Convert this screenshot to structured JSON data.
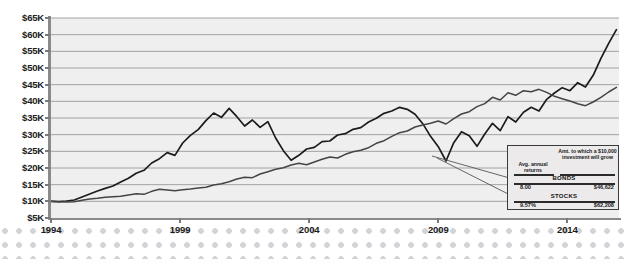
{
  "chart_data": {
    "type": "line",
    "title": "",
    "xlabel": "",
    "ylabel": "",
    "xlim": [
      1994,
      2016
    ],
    "ylim": [
      5000,
      65000
    ],
    "grid": true,
    "legend_position": "inside-bottom-right",
    "y_ticks": [
      "$5K",
      "$10K",
      "$15K",
      "$20K",
      "$25K",
      "$30K",
      "$35K",
      "$40K",
      "$45K",
      "$50K",
      "$55K",
      "$60K",
      "$65K"
    ],
    "y_tick_values": [
      5000,
      10000,
      15000,
      20000,
      25000,
      30000,
      35000,
      40000,
      45000,
      50000,
      55000,
      60000,
      65000
    ],
    "x_ticks": [
      "1994",
      "1999",
      "2004",
      "2009",
      "2014"
    ],
    "x_tick_values": [
      1994,
      1999,
      2004,
      2009,
      2014
    ],
    "series": [
      {
        "name": "STOCKS",
        "color": "#1c1c1c",
        "x": [
          1994.0,
          1994.3,
          1994.6,
          1994.9,
          1995.2,
          1995.5,
          1995.8,
          1996.1,
          1996.4,
          1996.7,
          1997.0,
          1997.3,
          1997.6,
          1997.9,
          1998.2,
          1998.5,
          1998.8,
          1999.1,
          1999.4,
          1999.7,
          2000.0,
          2000.3,
          2000.6,
          2000.9,
          2001.2,
          2001.5,
          2001.8,
          2002.1,
          2002.4,
          2002.7,
          2003.0,
          2003.3,
          2003.6,
          2003.9,
          2004.2,
          2004.5,
          2004.8,
          2005.1,
          2005.4,
          2005.7,
          2006.0,
          2006.3,
          2006.6,
          2006.9,
          2007.2,
          2007.5,
          2007.8,
          2008.1,
          2008.4,
          2008.7,
          2009.0,
          2009.3,
          2009.6,
          2009.9,
          2010.2,
          2010.5,
          2010.8,
          2011.1,
          2011.4,
          2011.7,
          2012.0,
          2012.3,
          2012.6,
          2012.9,
          2013.2,
          2013.5,
          2013.8,
          2014.1,
          2014.4,
          2014.7,
          2015.0,
          2015.3,
          2015.6,
          2015.9
        ],
        "values": [
          10000,
          9900,
          10100,
          10400,
          11300,
          12200,
          13100,
          13900,
          14600,
          15800,
          16900,
          18400,
          19300,
          21500,
          22800,
          24600,
          23800,
          27500,
          29800,
          31500,
          34200,
          36500,
          35200,
          37900,
          35400,
          32600,
          34400,
          32200,
          33900,
          29000,
          25200,
          22300,
          23800,
          25700,
          26200,
          27900,
          28100,
          29900,
          30300,
          31600,
          32100,
          33800,
          34900,
          36400,
          37100,
          38200,
          37600,
          36100,
          33300,
          29500,
          26400,
          22100,
          27600,
          30900,
          29700,
          26500,
          30200,
          33400,
          31200,
          35400,
          33800,
          36700,
          38200,
          37100,
          40600,
          42500,
          44100,
          43200,
          45600,
          44300,
          47800,
          52900,
          57400,
          61500
        ]
      },
      {
        "name": "BONDS",
        "color": "#444444",
        "x": [
          1994.0,
          1994.3,
          1994.6,
          1994.9,
          1995.2,
          1995.5,
          1995.8,
          1996.1,
          1996.4,
          1996.7,
          1997.0,
          1997.3,
          1997.6,
          1997.9,
          1998.2,
          1998.5,
          1998.8,
          1999.1,
          1999.4,
          1999.7,
          2000.0,
          2000.3,
          2000.6,
          2000.9,
          2001.2,
          2001.5,
          2001.8,
          2002.1,
          2002.4,
          2002.7,
          2003.0,
          2003.3,
          2003.6,
          2003.9,
          2004.2,
          2004.5,
          2004.8,
          2005.1,
          2005.4,
          2005.7,
          2006.0,
          2006.3,
          2006.6,
          2006.9,
          2007.2,
          2007.5,
          2007.8,
          2008.1,
          2008.4,
          2008.7,
          2009.0,
          2009.3,
          2009.6,
          2009.9,
          2010.2,
          2010.5,
          2010.8,
          2011.1,
          2011.4,
          2011.7,
          2012.0,
          2012.3,
          2012.6,
          2012.9,
          2013.2,
          2013.5,
          2013.8,
          2014.1,
          2014.4,
          2014.7,
          2015.0,
          2015.3,
          2015.6,
          2015.9
        ],
        "values": [
          10000,
          9850,
          9800,
          9900,
          10300,
          10700,
          10900,
          11200,
          11400,
          11500,
          11900,
          12300,
          12100,
          13000,
          13600,
          13400,
          13200,
          13500,
          13700,
          14000,
          14200,
          14900,
          15300,
          15900,
          16700,
          17200,
          17100,
          18200,
          18900,
          19600,
          20100,
          20900,
          21400,
          21000,
          21800,
          22600,
          23300,
          23000,
          24100,
          24900,
          25300,
          26100,
          27400,
          28200,
          29500,
          30600,
          31100,
          32300,
          32900,
          33400,
          34100,
          33200,
          34800,
          36200,
          36900,
          38400,
          39300,
          41200,
          40400,
          42600,
          41800,
          43200,
          42900,
          43600,
          42700,
          41500,
          40800,
          40100,
          39300,
          38700,
          39800,
          41200,
          42800,
          44200
        ]
      }
    ],
    "annotation_table": {
      "col_header_left": "Avg. annual returns",
      "col_header_right": "Amt. to which a $10,000 investment will grow",
      "rows": [
        {
          "name": "BONDS",
          "avg_annual_return": "8.00",
          "growth": "$46,622"
        },
        {
          "name": "STOCKS",
          "avg_annual_return": "9.57%",
          "growth": "$62,208"
        }
      ]
    }
  }
}
